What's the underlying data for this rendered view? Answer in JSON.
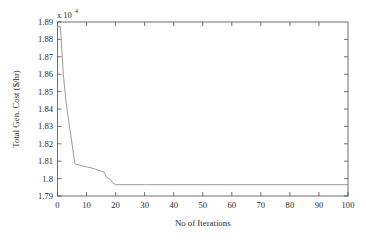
{
  "chart_data": {
    "type": "line",
    "title": "",
    "xlabel": "No of Iterations",
    "ylabel": "Total Gen. Cost ($/hr)",
    "y_exponent_label": "x 10",
    "y_exponent_power": "4",
    "xlim": [
      0,
      100
    ],
    "ylim": [
      17900,
      18900
    ],
    "y_scale": 10000,
    "grid": false,
    "legend": null,
    "xticks": [
      0,
      10,
      20,
      30,
      40,
      50,
      60,
      70,
      80,
      90,
      100
    ],
    "xticklabels": [
      "0",
      "10",
      "20",
      "30",
      "40",
      "50",
      "60",
      "70",
      "80",
      "90",
      "100"
    ],
    "yticks": [
      17900,
      18000,
      18100,
      18200,
      18300,
      18400,
      18500,
      18600,
      18700,
      18800,
      18900
    ],
    "yticklabels": [
      "1.79",
      "1.8",
      "1.81",
      "1.82",
      "1.83",
      "1.84",
      "1.85",
      "1.86",
      "1.87",
      "1.88",
      "1.89"
    ],
    "series": [
      {
        "name": "Total Generation Cost",
        "color": "#8e8e8e",
        "x": [
          0,
          1,
          2,
          3,
          6,
          8,
          12,
          15,
          16,
          17,
          18,
          19,
          20,
          25,
          30,
          40,
          50,
          60,
          70,
          80,
          90,
          100
        ],
        "y": [
          18875,
          18872,
          18600,
          18430,
          18085,
          18075,
          18060,
          18043,
          18038,
          18005,
          17998,
          17975,
          17965,
          17965,
          17965,
          17965,
          17965,
          17965,
          17965,
          17965,
          17965,
          17965
        ]
      }
    ],
    "annotations": []
  },
  "figure": {
    "background_color": "#ffffff",
    "axis_color": "#4d4d4d",
    "line_color": "#8e8e8e"
  }
}
